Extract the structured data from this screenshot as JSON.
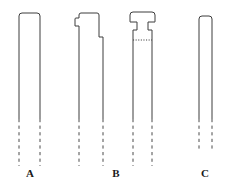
{
  "figure": {
    "background_color": "#ffffff",
    "stroke_color": "#3c3c3c",
    "dash_color": "#4a4a4a",
    "label_color": "#1a1a1a",
    "width": 226,
    "height": 195
  },
  "specimens": [
    {
      "id": "a",
      "label": "A",
      "label_x": 30,
      "label_y": 174,
      "head_style": "plain-rounded-cap",
      "body_left_x": 19,
      "body_right_x": 40,
      "body_top_y": 13,
      "solid_bottom_y": 119,
      "dashed_bottom_y": 166,
      "corner_radius": 3,
      "has_parting_line": false
    },
    {
      "id": "b-left",
      "label": "",
      "head_style": "stepped-shoulder-notch",
      "body_left_x": 79,
      "body_right_x": 99,
      "body_top_y": 13,
      "solid_bottom_y": 119,
      "dashed_bottom_y": 166,
      "corner_radius": 2,
      "has_parting_line": false,
      "notch_left_x": 75,
      "notch_top_y": 18,
      "notch_bottom_y": 26,
      "step_right_x": 103,
      "step_y": 37
    },
    {
      "id": "b-right",
      "label": "",
      "head_style": "flared-t-head",
      "body_left_x": 133,
      "body_right_x": 152,
      "body_top_y": 12,
      "solid_bottom_y": 119,
      "dashed_bottom_y": 166,
      "corner_radius": 3,
      "has_parting_line": true,
      "parting_line_y": 40,
      "head_left_x": 130,
      "head_right_x": 155,
      "neck_left_x": 137,
      "neck_right_x": 148,
      "head_bottom_y": 22,
      "shoulder_y": 30
    },
    {
      "id": "c",
      "label": "C",
      "label_x": 205,
      "label_y": 174,
      "head_style": "plain-rounded-cap",
      "body_left_x": 199,
      "body_right_x": 212,
      "body_top_y": 16,
      "solid_bottom_y": 119,
      "dashed_bottom_y": 152,
      "corner_radius": 3,
      "has_parting_line": false
    }
  ],
  "group_labels": [
    {
      "id": "label-a",
      "text": "A",
      "x": 30,
      "y": 174
    },
    {
      "id": "label-b",
      "text": "B",
      "x": 116,
      "y": 174
    },
    {
      "id": "label-c",
      "text": "C",
      "x": 205,
      "y": 174
    }
  ]
}
